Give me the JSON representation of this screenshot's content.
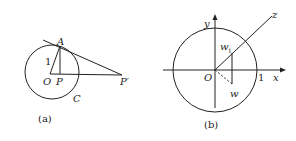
{
  "figure_a": {
    "caption": "(a)",
    "labels": {
      "A": "A",
      "O": "O",
      "P": "P",
      "P_prime": "P′",
      "C": "C",
      "radius": "1"
    }
  },
  "figure_b": {
    "caption": "(b)",
    "labels": {
      "y": "y",
      "x": "x",
      "z": "z",
      "O": "O",
      "one": "1",
      "w1_base": "w",
      "w1_sub": "1",
      "w": "w"
    }
  },
  "colors": {
    "stroke": "#222222",
    "background": "#ffffff"
  }
}
